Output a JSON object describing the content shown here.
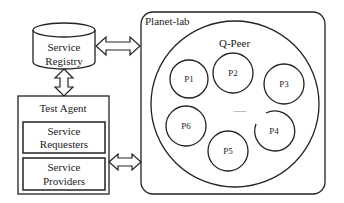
{
  "diagram": {
    "service_registry": {
      "line1": "Service",
      "line2": "Registry"
    },
    "test_agent": {
      "title": "Test Agent",
      "requesters": {
        "line1": "Service",
        "line2": "Requesters"
      },
      "providers": {
        "line1": "Service",
        "line2": "Providers"
      }
    },
    "planet_lab": {
      "title": "Planet-lab"
    },
    "q_peer": {
      "title": "Q-Peer",
      "peers": [
        "P1",
        "P2",
        "P3",
        "P4",
        "P5",
        "P6"
      ],
      "ellipsis": "......"
    },
    "colors": {
      "stroke": "#222222",
      "background": "#ffffff"
    }
  }
}
